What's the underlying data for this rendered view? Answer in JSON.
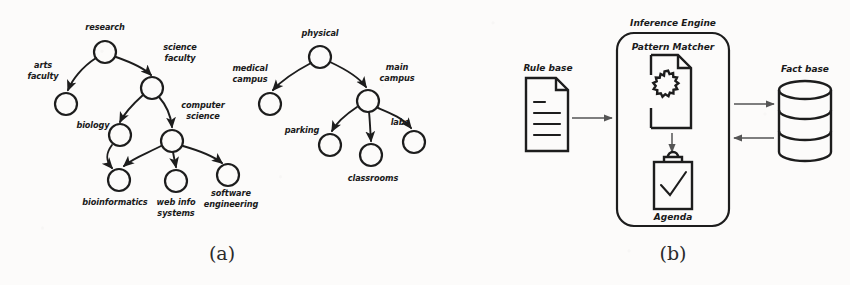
{
  "figure": {
    "background_color": "#fcfbfa",
    "ink_color": "#1d1d1d",
    "arrow_color": "#555555"
  },
  "panel_a": {
    "caption": "(a)",
    "trees": [
      {
        "name": "academic-tree",
        "nodes": [
          {
            "id": "research",
            "label": "research",
            "cx": 105,
            "cy": 52,
            "r": 11,
            "label_x": 105,
            "label_y": 30,
            "anchor": "middle",
            "lines": [
              "research"
            ]
          },
          {
            "id": "arts-faculty",
            "label": "arts faculty",
            "cx": 66,
            "cy": 104,
            "r": 11,
            "label_x": 43,
            "label_y": 72,
            "anchor": "middle",
            "lines": [
              "arts",
              "faculty"
            ]
          },
          {
            "id": "science-faculty",
            "label": "science faculty",
            "cx": 152,
            "cy": 88,
            "r": 11,
            "label_x": 178,
            "label_y": 54,
            "anchor": "middle",
            "lines": [
              "science",
              "faculty"
            ]
          },
          {
            "id": "biology",
            "label": "biology",
            "cx": 120,
            "cy": 135,
            "r": 11,
            "label_x": 94,
            "label_y": 130,
            "anchor": "middle",
            "lines": [
              "biology"
            ]
          },
          {
            "id": "computer-science",
            "label": "computer science",
            "cx": 172,
            "cy": 141,
            "r": 11,
            "label_x": 200,
            "label_y": 112,
            "anchor": "middle",
            "lines": [
              "computer",
              "science"
            ]
          },
          {
            "id": "bioinformatics",
            "label": "bioinformatics",
            "cx": 119,
            "cy": 180,
            "r": 11,
            "label_x": 115,
            "label_y": 205,
            "anchor": "middle",
            "lines": [
              "bioinformatics"
            ]
          },
          {
            "id": "web-info-systems",
            "label": "web info systems",
            "cx": 176,
            "cy": 181,
            "r": 11,
            "label_x": 176,
            "label_y": 205,
            "anchor": "middle",
            "lines": [
              "web info",
              "systems"
            ]
          },
          {
            "id": "software-engineering",
            "label": "software engineering",
            "cx": 228,
            "cy": 175,
            "r": 11,
            "label_x": 231,
            "label_y": 198,
            "anchor": "middle",
            "lines": [
              "software",
              "engineering"
            ]
          }
        ],
        "edges": [
          {
            "from": "research",
            "to": "arts-faculty"
          },
          {
            "from": "research",
            "to": "science-faculty"
          },
          {
            "from": "science-faculty",
            "to": "biology"
          },
          {
            "from": "science-faculty",
            "to": "computer-science"
          },
          {
            "from": "biology",
            "to": "bioinformatics"
          },
          {
            "from": "computer-science",
            "to": "bioinformatics"
          },
          {
            "from": "computer-science",
            "to": "web-info-systems"
          },
          {
            "from": "computer-science",
            "to": "software-engineering"
          }
        ]
      },
      {
        "name": "physical-tree",
        "nodes": [
          {
            "id": "physical",
            "label": "physical",
            "cx": 320,
            "cy": 57,
            "r": 11,
            "label_x": 320,
            "label_y": 36,
            "anchor": "middle",
            "lines": [
              "physical"
            ]
          },
          {
            "id": "medical-campus",
            "label": "medical campus",
            "cx": 270,
            "cy": 104,
            "r": 11,
            "label_x": 249,
            "label_y": 75,
            "anchor": "middle",
            "lines": [
              "medical",
              "campus"
            ]
          },
          {
            "id": "main-campus",
            "label": "main campus",
            "cx": 368,
            "cy": 101,
            "r": 11,
            "label_x": 394,
            "label_y": 74,
            "anchor": "middle",
            "lines": [
              "main",
              "campus"
            ]
          },
          {
            "id": "parking",
            "label": "parking",
            "cx": 330,
            "cy": 145,
            "r": 11,
            "label_x": 303,
            "label_y": 134,
            "anchor": "middle",
            "lines": [
              "parking"
            ]
          },
          {
            "id": "classrooms",
            "label": "classrooms",
            "cx": 371,
            "cy": 155,
            "r": 11,
            "label_x": 373,
            "label_y": 180,
            "anchor": "middle",
            "lines": [
              "classrooms"
            ]
          },
          {
            "id": "labs",
            "label": "labs",
            "cx": 414,
            "cy": 142,
            "r": 11,
            "label_x": 400,
            "label_y": 126,
            "anchor": "middle",
            "lines": [
              "labs"
            ]
          }
        ],
        "edges": [
          {
            "from": "physical",
            "to": "medical-campus"
          },
          {
            "from": "physical",
            "to": "main-campus"
          },
          {
            "from": "main-campus",
            "to": "parking"
          },
          {
            "from": "main-campus",
            "to": "classrooms"
          },
          {
            "from": "main-campus",
            "to": "labs"
          }
        ]
      }
    ]
  },
  "panel_b": {
    "caption": "(b)",
    "rule_base": {
      "label": "Rule base",
      "icon": "document-lines-icon",
      "line_count": 4
    },
    "fact_base": {
      "label": "Fact base",
      "icon": "database-cylinder-icon",
      "segments": 3
    },
    "inference_engine": {
      "label": "Inference Engine",
      "components": [
        {
          "id": "pattern-matcher",
          "label": "Pattern Matcher",
          "icon": "document-gear-icon"
        },
        {
          "id": "agenda",
          "label": "Agenda",
          "icon": "clipboard-check-icon"
        }
      ]
    },
    "flows": [
      {
        "id": "rule-base-to-engine",
        "direction": "right"
      },
      {
        "id": "engine-to-fact-base",
        "direction": "right"
      },
      {
        "id": "fact-base-to-engine",
        "direction": "left"
      },
      {
        "id": "matcher-to-agenda",
        "direction": "down"
      }
    ]
  }
}
